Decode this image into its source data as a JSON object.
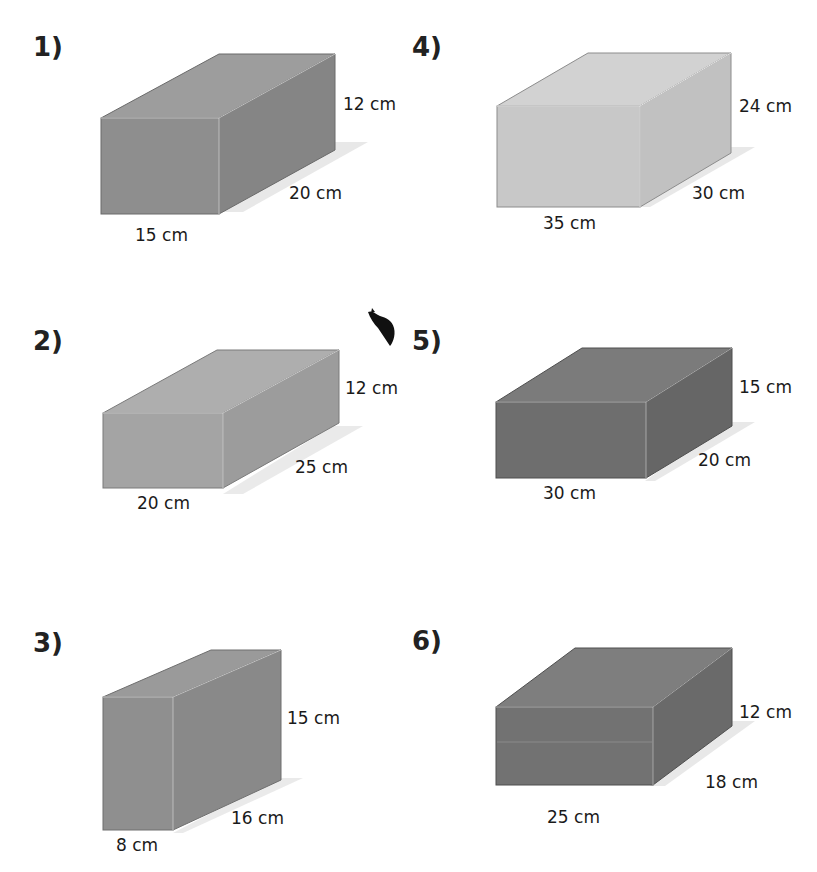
{
  "top_fragment": "",
  "problems": [
    {
      "number": "1)",
      "height": "12 cm",
      "depth": "20 cm",
      "width": "15 cm",
      "colors": {
        "front": "#8e8e8e",
        "top": "#9d9d9d",
        "side": "#858585"
      }
    },
    {
      "number": "2)",
      "height": "12 cm",
      "depth": "25 cm",
      "width": "20 cm",
      "colors": {
        "front": "#a4a4a4",
        "top": "#aeaeae",
        "side": "#9c9c9c"
      }
    },
    {
      "number": "3)",
      "height": "15 cm",
      "depth": "16 cm",
      "width": "8 cm",
      "colors": {
        "front": "#8f8f8f",
        "top": "#9a9a9a",
        "side": "#898989"
      }
    },
    {
      "number": "4)",
      "height": "24 cm",
      "depth": "30 cm",
      "width": "35 cm",
      "colors": {
        "front": "#c8c8c8",
        "top": "#d2d2d2",
        "side": "#c1c1c1"
      }
    },
    {
      "number": "5)",
      "height": "15 cm",
      "depth": "20 cm",
      "width": "30 cm",
      "colors": {
        "front": "#6e6e6e",
        "top": "#7b7b7b",
        "side": "#666666"
      }
    },
    {
      "number": "6)",
      "height": "12 cm",
      "depth": "18 cm",
      "width": "25 cm",
      "colors": {
        "front": "#727272",
        "top": "#7e7e7e",
        "side": "#6a6a6a"
      }
    }
  ]
}
